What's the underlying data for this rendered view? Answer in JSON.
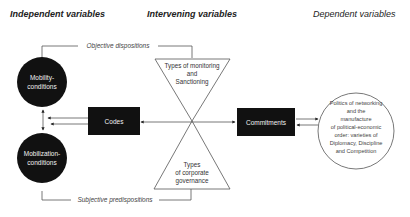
{
  "headers": {
    "independent": "Independent variables",
    "intervening": "Intervening variables",
    "dependent": "Dependent variables"
  },
  "brackets": {
    "top": "Objective dispositions",
    "bottom": "Subjective predispositions"
  },
  "nodes": {
    "mobility": [
      "Mobility-",
      "conditions"
    ],
    "mobilization": [
      "Mobilization-",
      "conditions"
    ],
    "codes": "Codes",
    "commitments": "Commitments",
    "top_triangle": [
      "Types of monitoring",
      "and",
      "Sanctioning"
    ],
    "bottom_triangle": [
      "Types",
      "of corporate",
      "governance"
    ],
    "outcome": [
      "Politics of networking",
      "and the",
      "manufacture",
      "of political-economic",
      "order: varieties of",
      "Diplomacy, Discipline",
      "and Competition"
    ]
  },
  "colors": {
    "dark_node": "#111111",
    "line": "#555555"
  }
}
